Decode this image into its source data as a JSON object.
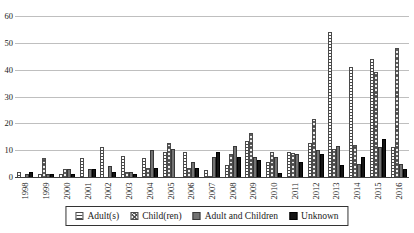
{
  "chart_data": {
    "type": "bar",
    "title": "",
    "xlabel": "",
    "ylabel": "",
    "categories": [
      "1998",
      "1999",
      "2000",
      "2001",
      "2002",
      "2003",
      "2004",
      "2005",
      "2006",
      "2007",
      "2008",
      "2009",
      "2010",
      "2011",
      "2012",
      "2013",
      "2014",
      "2015",
      "2016"
    ],
    "series": [
      {
        "name": "Adult(s)",
        "pattern": "horizontal-stripes",
        "css_class": "adults",
        "values": [
          2,
          1,
          1,
          7,
          11,
          8,
          7,
          9.5,
          9.5,
          2.5,
          4.5,
          13.5,
          5.5,
          9.5,
          12.5,
          54,
          41,
          44,
          11
        ]
      },
      {
        "name": "Child(ren)",
        "pattern": "diagonal-crosshatch",
        "css_class": "children",
        "values": [
          0,
          7,
          3,
          0,
          0,
          2,
          3.5,
          12.5,
          3.5,
          0.5,
          8.5,
          16.5,
          9.5,
          9,
          21.5,
          10.5,
          12,
          39,
          48
        ]
      },
      {
        "name": "Adult and Children",
        "pattern": "solid-dark-gray",
        "css_class": "adult-children",
        "values": [
          1,
          1,
          3,
          3,
          4,
          2,
          10,
          10.5,
          5.5,
          7.5,
          11.5,
          7.5,
          7.5,
          8.5,
          10,
          11.5,
          5,
          11,
          5
        ]
      },
      {
        "name": "Unknown",
        "pattern": "solid-black",
        "css_class": "unknown",
        "values": [
          2,
          1,
          1,
          3,
          2,
          1,
          3.5,
          0,
          3.5,
          9.5,
          7.5,
          6.5,
          1.5,
          5.5,
          8.5,
          4.5,
          7.5,
          14,
          3
        ]
      }
    ],
    "ylim": [
      0,
      60
    ],
    "ytick_step": 10,
    "ytick_labels": [
      "0",
      "10",
      "20",
      "30",
      "40",
      "50",
      "60"
    ],
    "grid": "horizontal",
    "legend_position": "bottom-center-boxed"
  },
  "colors": {
    "background": "#ffffff",
    "gridline": "#bfbfbf",
    "axis": "#404040",
    "text": "#1a1a1a",
    "bar_dark_gray": "#737373",
    "bar_black": "#141414"
  }
}
